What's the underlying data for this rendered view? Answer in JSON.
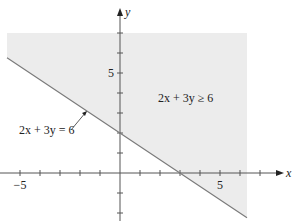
{
  "chart_data": {
    "type": "area",
    "title": "",
    "xlabel": "x",
    "ylabel": "y",
    "xlim": [
      -5.6,
      6.4
    ],
    "ylim": [
      -2.4,
      8.2
    ],
    "grid": false,
    "x_ticks": [
      -5,
      -4,
      -3,
      -2,
      -1,
      1,
      2,
      3,
      4,
      5,
      6,
      7
    ],
    "y_ticks": [
      -2,
      -1,
      1,
      2,
      3,
      4,
      5,
      6,
      7
    ],
    "x_tick_labels": [
      {
        "value": -5,
        "label": "−5"
      },
      {
        "value": 5,
        "label": "5"
      }
    ],
    "y_tick_labels": [
      {
        "value": 5,
        "label": "5"
      }
    ],
    "boundary_line": {
      "equation": "2x + 3y = 6",
      "x_intercept": 3,
      "y_intercept": 2,
      "slope": -0.6667,
      "x_range": [
        -5.65,
        6.35
      ]
    },
    "shaded_region": {
      "inequality": "2x + 3y ≥ 6",
      "description": "region above the line",
      "x_range": [
        -5.65,
        6.35
      ],
      "y_max": 7
    },
    "annotations": [
      {
        "text": "2x + 3y = 6",
        "points_to": "boundary line",
        "x": -1.65,
        "y": 3.1
      },
      {
        "text": "2x + 3y ≥ 6",
        "location": "inside shaded region"
      }
    ],
    "colors": {
      "shade": "#ececec",
      "line": "#7a7a7a",
      "axis": "#555555"
    }
  }
}
